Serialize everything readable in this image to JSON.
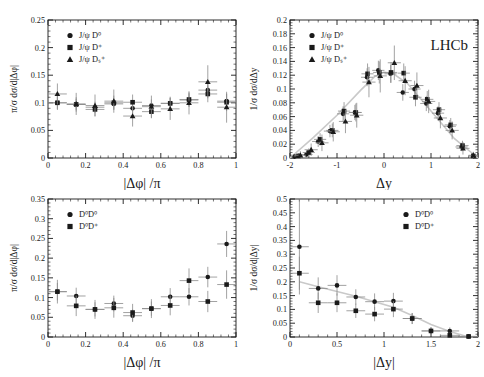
{
  "figure": {
    "experiment_label": "LHCb",
    "background": "#ffffff",
    "marker_color": "#1a1a1a",
    "errorbar_color": "#8a8a8a",
    "guide_color": "#c9c9c9",
    "axis_color": "#1a1a1a"
  },
  "chart_data": [
    {
      "panel": "top-left",
      "type": "scatter",
      "title": "",
      "xlabel": "|Δφ| /π",
      "ylabel": "π/σ dσ/d|Δφ|",
      "xlim": [
        0,
        1
      ],
      "ylim": [
        0,
        0.25
      ],
      "xticks": [
        0,
        0.2,
        0.4,
        0.6,
        0.8,
        1
      ],
      "xticklabels": [
        "0",
        "0.2",
        "0.4",
        "0.6",
        "0.8",
        "1"
      ],
      "yticks": [
        0,
        0.05,
        0.1,
        0.15,
        0.2,
        0.25
      ],
      "yticklabels": [
        "0",
        "0.05",
        "0.1",
        "0.15",
        "0.2",
        "0.25"
      ],
      "grid": false,
      "legend_position": "upper-left",
      "legend": [
        {
          "label": "J/ψ D⁰",
          "marker": "circle"
        },
        {
          "label": "J/ψ D⁺",
          "marker": "square"
        },
        {
          "label": "J/ψ Dₛ⁺",
          "marker": "triangle"
        }
      ],
      "guide_line": [],
      "series": [
        {
          "name": "J/ψ D⁰",
          "marker": "circle",
          "x": [
            0.05,
            0.15,
            0.25,
            0.35,
            0.45,
            0.55,
            0.65,
            0.75,
            0.85,
            0.95
          ],
          "y": [
            0.1,
            0.097,
            0.092,
            0.098,
            0.09,
            0.095,
            0.099,
            0.105,
            0.123,
            0.103
          ],
          "xerr": [
            0.05,
            0.05,
            0.05,
            0.05,
            0.05,
            0.05,
            0.05,
            0.05,
            0.05,
            0.05
          ],
          "yerr": [
            0.011,
            0.01,
            0.01,
            0.01,
            0.011,
            0.011,
            0.01,
            0.012,
            0.013,
            0.013
          ]
        },
        {
          "name": "J/ψ D⁺",
          "marker": "square",
          "x": [
            0.05,
            0.15,
            0.25,
            0.35,
            0.45,
            0.55,
            0.65,
            0.75,
            0.85,
            0.95
          ],
          "y": [
            0.1,
            0.097,
            0.088,
            0.1,
            0.101,
            0.084,
            0.099,
            0.106,
            0.116,
            0.101
          ],
          "xerr": [
            0.05,
            0.05,
            0.05,
            0.05,
            0.05,
            0.05,
            0.05,
            0.05,
            0.05,
            0.05
          ],
          "yerr": [
            0.013,
            0.013,
            0.012,
            0.013,
            0.014,
            0.012,
            0.012,
            0.013,
            0.015,
            0.016
          ]
        },
        {
          "name": "J/ψ Dₛ⁺",
          "marker": "triangle",
          "x": [
            0.05,
            0.15,
            0.25,
            0.35,
            0.45,
            0.55,
            0.65,
            0.75,
            0.85,
            0.95
          ],
          "y": [
            0.116,
            0.098,
            0.095,
            0.103,
            0.076,
            0.093,
            0.089,
            0.1,
            0.138,
            0.092
          ],
          "xerr": [
            0.05,
            0.05,
            0.05,
            0.05,
            0.05,
            0.05,
            0.05,
            0.05,
            0.05,
            0.05
          ],
          "yerr": [
            0.019,
            0.02,
            0.02,
            0.021,
            0.019,
            0.02,
            0.02,
            0.021,
            0.03,
            0.028
          ]
        }
      ]
    },
    {
      "panel": "top-right",
      "type": "scatter",
      "title": "",
      "xlabel": "Δy",
      "ylabel": "1/σ dσ/dΔy",
      "xlim": [
        -2,
        2
      ],
      "ylim": [
        0,
        0.2
      ],
      "xticks": [
        -2,
        -1,
        0,
        1,
        2
      ],
      "xticklabels": [
        "-2",
        "-1",
        "0",
        "1",
        "2"
      ],
      "yticks": [
        0,
        0.02,
        0.04,
        0.06,
        0.08,
        0.1,
        0.12,
        0.14,
        0.16,
        0.18,
        0.2
      ],
      "yticklabels": [
        "0",
        "0.02",
        "0.04",
        "0.06",
        "0.08",
        "0.1",
        "0.12",
        "0.14",
        "0.16",
        "0.18",
        "0.2"
      ],
      "grid": false,
      "legend_position": "upper-left",
      "legend": [
        {
          "label": "J/ψ D⁰",
          "marker": "circle"
        },
        {
          "label": "J/ψ D⁺",
          "marker": "square"
        },
        {
          "label": "J/ψ Dₛ⁺",
          "marker": "triangle"
        }
      ],
      "guide_line": {
        "x": [
          -2,
          -1.5,
          -1,
          -0.5,
          -0.2,
          0,
          0.2,
          0.5,
          1,
          1.5,
          2
        ],
        "y": [
          0.0,
          0.03,
          0.062,
          0.098,
          0.118,
          0.124,
          0.122,
          0.108,
          0.068,
          0.028,
          0.0
        ]
      },
      "series": [
        {
          "name": "J/ψ D⁰",
          "marker": "circle",
          "x": [
            -1.9,
            -1.65,
            -1.4,
            -1.15,
            -0.87,
            -0.62,
            -0.36,
            -0.12,
            0.14,
            0.4,
            0.65,
            0.9,
            1.15,
            1.4,
            1.65,
            1.9
          ],
          "y": [
            0.002,
            0.005,
            0.024,
            0.039,
            0.064,
            0.066,
            0.117,
            0.127,
            0.122,
            0.095,
            0.1,
            0.079,
            0.065,
            0.046,
            0.016,
            0.003
          ],
          "xerr": [
            0.1,
            0.13,
            0.13,
            0.13,
            0.13,
            0.13,
            0.13,
            0.13,
            0.13,
            0.13,
            0.13,
            0.13,
            0.13,
            0.13,
            0.13,
            0.1
          ],
          "yerr": [
            0.003,
            0.005,
            0.008,
            0.009,
            0.011,
            0.011,
            0.013,
            0.014,
            0.013,
            0.012,
            0.012,
            0.011,
            0.01,
            0.009,
            0.006,
            0.003
          ]
        },
        {
          "name": "J/ψ D⁺",
          "marker": "square",
          "x": [
            -1.82,
            -1.6,
            -1.36,
            -1.1,
            -0.85,
            -0.6,
            -0.35,
            -0.1,
            0.15,
            0.42,
            0.67,
            0.92,
            1.17,
            1.42,
            1.67,
            1.9
          ],
          "y": [
            0.003,
            0.008,
            0.027,
            0.04,
            0.068,
            0.066,
            0.122,
            0.124,
            0.124,
            0.123,
            0.088,
            0.085,
            0.07,
            0.048,
            0.018,
            0.003
          ],
          "xerr": [
            0.1,
            0.13,
            0.13,
            0.13,
            0.13,
            0.13,
            0.13,
            0.13,
            0.13,
            0.13,
            0.13,
            0.13,
            0.13,
            0.13,
            0.13,
            0.1
          ],
          "yerr": [
            0.004,
            0.006,
            0.009,
            0.01,
            0.013,
            0.013,
            0.015,
            0.016,
            0.015,
            0.014,
            0.013,
            0.012,
            0.011,
            0.01,
            0.007,
            0.003
          ]
        },
        {
          "name": "J/ψ Dₛ⁺",
          "marker": "triangle",
          "x": [
            -1.78,
            -1.55,
            -1.32,
            -1.08,
            -0.82,
            -0.58,
            -0.32,
            -0.08,
            0.22,
            0.45,
            0.7,
            0.95,
            1.2,
            1.45,
            1.68,
            1.9
          ],
          "y": [
            0.004,
            0.012,
            0.022,
            0.038,
            0.053,
            0.062,
            0.11,
            0.119,
            0.138,
            0.112,
            0.105,
            0.082,
            0.058,
            0.04,
            0.014,
            0.004
          ],
          "xerr": [
            0.12,
            0.14,
            0.14,
            0.14,
            0.14,
            0.14,
            0.14,
            0.14,
            0.14,
            0.14,
            0.14,
            0.14,
            0.14,
            0.14,
            0.14,
            0.1
          ],
          "yerr": [
            0.006,
            0.009,
            0.012,
            0.014,
            0.017,
            0.018,
            0.022,
            0.024,
            0.025,
            0.021,
            0.019,
            0.017,
            0.015,
            0.013,
            0.009,
            0.005
          ]
        }
      ]
    },
    {
      "panel": "bottom-left",
      "type": "scatter",
      "title": "",
      "xlabel": "|Δφ| /π",
      "ylabel": "π/σ dσ/d|Δφ|",
      "xlim": [
        0,
        1
      ],
      "ylim": [
        0,
        0.35
      ],
      "xticks": [
        0,
        0.2,
        0.4,
        0.6,
        0.8,
        1
      ],
      "xticklabels": [
        "0",
        "0.2",
        "0.4",
        "0.6",
        "0.8",
        "1"
      ],
      "yticks": [
        0,
        0.05,
        0.1,
        0.15,
        0.2,
        0.25,
        0.3,
        0.35
      ],
      "yticklabels": [
        "0",
        "0.05",
        "0.1",
        "0.15",
        "0.2",
        "0.25",
        "0.3",
        "0.35"
      ],
      "grid": false,
      "legend_position": "upper-left",
      "legend": [
        {
          "label": "D⁰D⁰",
          "marker": "circle"
        },
        {
          "label": "D⁰D⁺",
          "marker": "square"
        }
      ],
      "guide_line": [],
      "series": [
        {
          "name": "D⁰D⁰",
          "marker": "circle",
          "x": [
            0.05,
            0.15,
            0.25,
            0.35,
            0.45,
            0.55,
            0.65,
            0.75,
            0.85,
            0.95
          ],
          "y": [
            0.115,
            0.104,
            0.07,
            0.085,
            0.054,
            0.072,
            0.102,
            0.102,
            0.152,
            0.236
          ],
          "xerr": [
            0.05,
            0.05,
            0.05,
            0.05,
            0.05,
            0.05,
            0.05,
            0.05,
            0.05,
            0.05
          ],
          "yerr": [
            0.022,
            0.021,
            0.018,
            0.02,
            0.016,
            0.018,
            0.022,
            0.022,
            0.026,
            0.033
          ]
        },
        {
          "name": "D⁰D⁺",
          "marker": "square",
          "x": [
            0.05,
            0.15,
            0.25,
            0.35,
            0.45,
            0.55,
            0.65,
            0.75,
            0.85,
            0.95
          ],
          "y": [
            0.115,
            0.079,
            0.07,
            0.074,
            0.062,
            0.072,
            0.08,
            0.143,
            0.09,
            0.133
          ],
          "xerr": [
            0.05,
            0.05,
            0.05,
            0.05,
            0.05,
            0.05,
            0.05,
            0.05,
            0.05,
            0.05
          ],
          "yerr": [
            0.03,
            0.026,
            0.024,
            0.025,
            0.022,
            0.024,
            0.025,
            0.031,
            0.027,
            0.036
          ]
        }
      ]
    },
    {
      "panel": "bottom-right",
      "type": "scatter",
      "title": "",
      "xlabel": "|Δy|",
      "ylabel": "1/σ dσ/d|Δy|",
      "xlim": [
        0,
        2
      ],
      "ylim": [
        0,
        0.5
      ],
      "xticks": [
        0,
        0.5,
        1,
        1.5,
        2
      ],
      "xticklabels": [
        "0",
        "0.5",
        "1",
        "1.5",
        "2"
      ],
      "yticks": [
        0,
        0.05,
        0.1,
        0.15,
        0.2,
        0.25,
        0.3,
        0.35,
        0.4,
        0.45,
        0.5
      ],
      "yticklabels": [
        "0",
        "0.05",
        "0.1",
        "0.15",
        "0.2",
        "0.25",
        "0.3",
        "0.35",
        "0.4",
        "0.45",
        "0.5"
      ],
      "grid": false,
      "legend_position": "upper-right",
      "legend": [
        {
          "label": "D⁰D⁰",
          "marker": "circle"
        },
        {
          "label": "D⁰D⁺",
          "marker": "square"
        }
      ],
      "guide_line": {
        "x": [
          0.1,
          0.3,
          0.5,
          0.7,
          0.9,
          1.1,
          1.3,
          1.5,
          1.7,
          1.9
        ],
        "y": [
          0.2,
          0.182,
          0.165,
          0.148,
          0.128,
          0.108,
          0.078,
          0.045,
          0.02,
          0.0
        ]
      },
      "series": [
        {
          "name": "D⁰D⁰",
          "marker": "circle",
          "x": [
            0.1,
            0.3,
            0.5,
            0.7,
            0.9,
            1.1,
            1.3,
            1.5,
            1.7,
            1.9
          ],
          "y": [
            0.327,
            0.176,
            0.187,
            0.145,
            0.128,
            0.13,
            0.067,
            0.022,
            0.022,
            0.002
          ],
          "xerr": [
            0.1,
            0.1,
            0.1,
            0.1,
            0.1,
            0.1,
            0.1,
            0.1,
            0.1,
            0.1
          ],
          "yerr": [
            0.173,
            0.04,
            0.037,
            0.028,
            0.03,
            0.03,
            0.02,
            0.013,
            0.013,
            0.004
          ]
        },
        {
          "name": "D⁰D⁺",
          "marker": "square",
          "x": [
            0.1,
            0.3,
            0.5,
            0.7,
            0.9,
            1.1,
            1.3,
            1.5,
            1.7,
            1.9
          ],
          "y": [
            0.231,
            0.124,
            0.124,
            0.095,
            0.083,
            0.101,
            0.067,
            0.022,
            0.006,
            0.002
          ],
          "xerr": [
            0.1,
            0.1,
            0.1,
            0.1,
            0.1,
            0.1,
            0.1,
            0.1,
            0.1,
            0.1
          ],
          "yerr": [
            0.06,
            0.037,
            0.034,
            0.026,
            0.026,
            0.029,
            0.02,
            0.014,
            0.01,
            0.004
          ]
        }
      ]
    }
  ]
}
